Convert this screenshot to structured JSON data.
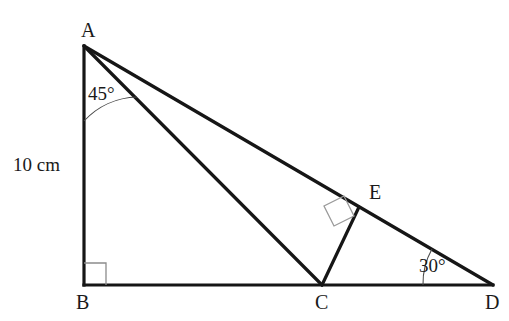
{
  "figure": {
    "background_color": "#ffffff",
    "stroke_color": "#161616",
    "arc_color": "#4a4a4a",
    "right_angle_color": "#8c8c8c",
    "stroke_width": 3.2,
    "thin_stroke_width": 1.1
  },
  "vertices": [
    {
      "name": "A",
      "label": "A",
      "x": 84,
      "y": 46,
      "label_x": 81,
      "label_y": 20
    },
    {
      "name": "B",
      "label": "B",
      "x": 84,
      "y": 285,
      "label_x": 76,
      "label_y": 292
    },
    {
      "name": "C",
      "label": "C",
      "x": 322,
      "y": 285,
      "label_x": 315,
      "label_y": 292
    },
    {
      "name": "D",
      "label": "D",
      "x": 493,
      "y": 285,
      "label_x": 485,
      "label_y": 292
    },
    {
      "name": "E",
      "label": "E",
      "x": 359,
      "y": 207,
      "label_x": 369,
      "label_y": 182
    }
  ],
  "segments": [
    {
      "name": "segment-AB",
      "from": "A",
      "to": "B",
      "x1": 84,
      "y1": 46,
      "x2": 84,
      "y2": 285
    },
    {
      "name": "segment-BD",
      "from": "B",
      "to": "D",
      "x1": 84,
      "y1": 285,
      "x2": 493,
      "y2": 285
    },
    {
      "name": "segment-AD",
      "from": "A",
      "to": "D",
      "x1": 84,
      "y1": 46,
      "x2": 493,
      "y2": 285
    },
    {
      "name": "segment-AC",
      "from": "A",
      "to": "C",
      "x1": 84,
      "y1": 46,
      "x2": 322,
      "y2": 285
    },
    {
      "name": "segment-CE",
      "from": "C",
      "to": "E",
      "x1": 322,
      "y1": 285,
      "x2": 359,
      "y2": 207
    }
  ],
  "angles": [
    {
      "name": "angle-at-A",
      "value": "45°",
      "vertex": "A",
      "label_x": 88,
      "label_y": 84,
      "arc_path": "M 84 121 A 75 75 0 0 1 137 97"
    },
    {
      "name": "angle-at-D",
      "value": "30°",
      "vertex": "D",
      "label_x": 419,
      "label_y": 256,
      "arc_path": "M 423 285 A 70 70 0 0 1 432 249"
    }
  ],
  "right_angles": [
    {
      "name": "right-angle-at-B",
      "at": "B",
      "path": "M 84 263 L 106 263 L 106 285"
    },
    {
      "name": "right-angle-at-E",
      "at": "E",
      "path": "M 344 196 L 324 206 L 334 226 L 354 216 Z"
    }
  ],
  "measurements": [
    {
      "name": "length-AB",
      "text": "10 cm",
      "applies_to": "segment-AB",
      "label_x": 13,
      "label_y": 155
    }
  ]
}
